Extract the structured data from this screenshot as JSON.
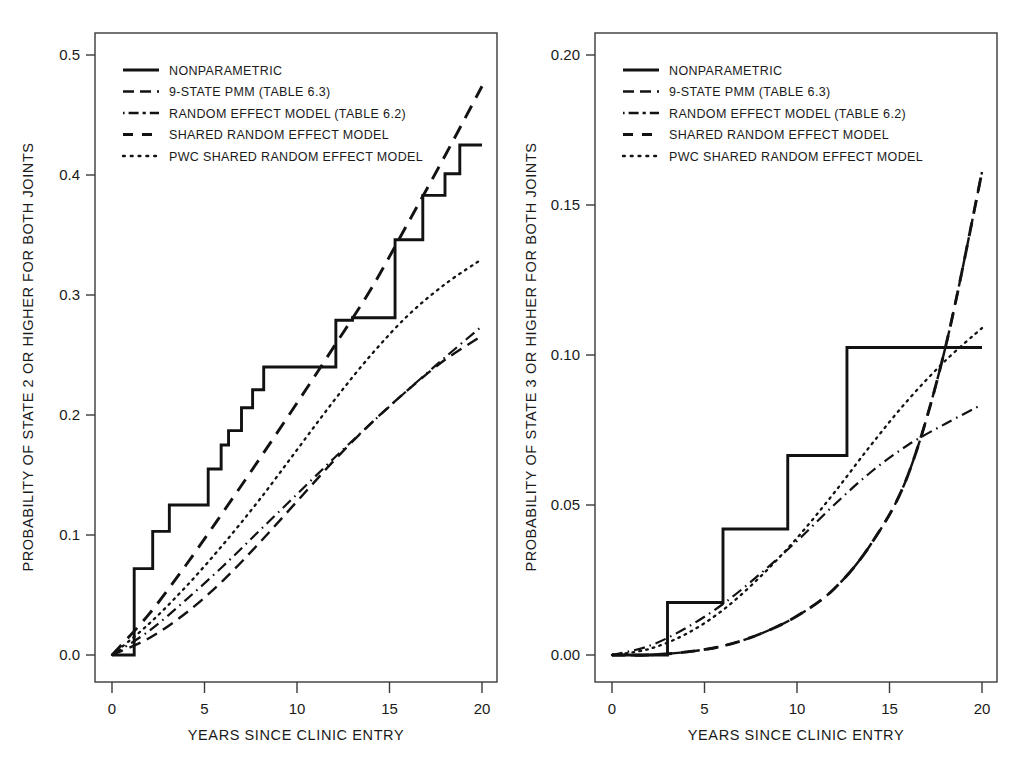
{
  "figure": {
    "title": "",
    "panel_count": 2
  },
  "legend": {
    "entries": [
      {
        "label": "NONPARAMETRIC",
        "style": "solid"
      },
      {
        "label": "9-STATE  PMM  (TABLE 6.3)",
        "style": "dashed"
      },
      {
        "label": "RANDOM  EFFECT  MODEL  (TABLE 6.2)",
        "style": "dash-dot"
      },
      {
        "label": "SHARED  RANDOM EFFECT  MODEL",
        "style": "long-dashed"
      },
      {
        "label": "PWC SHARED  RANDOM  EFFECT  MODEL",
        "style": "dotted"
      }
    ]
  },
  "chart_data": [
    {
      "panel": "left",
      "type": "line",
      "title": "",
      "xlabel": "YEARS SINCE CLINIC ENTRY",
      "ylabel": "PROBABILITY OF STATE 2 OR HIGHER FOR BOTH JOINTS",
      "xlim": [
        0,
        20
      ],
      "ylim": [
        0.0,
        0.5
      ],
      "xticks": [
        0,
        5,
        10,
        15,
        20
      ],
      "xticklabels": [
        "0",
        "5",
        "10",
        "15",
        "20"
      ],
      "yticks": [
        0.0,
        0.1,
        0.2,
        0.3,
        0.4,
        0.5
      ],
      "yticklabels": [
        "0.0",
        "0.1",
        "0.2",
        "0.3",
        "0.4",
        "0.5"
      ],
      "grid": false,
      "legend_position": "top-left",
      "series": [
        {
          "name": "NONPARAMETRIC",
          "style": "solid",
          "kind": "step",
          "x": [
            0,
            1.2,
            1.2,
            2.2,
            2.2,
            3.1,
            3.1,
            3.6,
            3.6,
            5.2,
            5.2,
            5.9,
            5.9,
            6.3,
            6.3,
            7.0,
            7.0,
            7.6,
            7.6,
            8.2,
            8.2,
            9.0,
            9.0,
            12.1,
            12.1,
            13.0,
            13.0,
            15.3,
            15.3,
            16.0,
            16.0,
            16.8,
            16.8,
            18.0,
            18.0,
            18.8,
            18.8,
            20.0
          ],
          "y": [
            0.0,
            0.0,
            0.072,
            0.072,
            0.103,
            0.103,
            0.125,
            0.125,
            0.125,
            0.125,
            0.155,
            0.155,
            0.175,
            0.175,
            0.187,
            0.187,
            0.206,
            0.206,
            0.221,
            0.221,
            0.24,
            0.24,
            0.24,
            0.24,
            0.279,
            0.279,
            0.281,
            0.281,
            0.346,
            0.346,
            0.346,
            0.346,
            0.383,
            0.383,
            0.401,
            0.401,
            0.425,
            0.425
          ]
        },
        {
          "name": "9-STATE  PMM  (TABLE 6.3)",
          "style": "dashed",
          "kind": "smooth",
          "x": [
            0,
            2,
            4,
            6,
            8,
            10,
            12,
            14,
            16,
            18,
            20
          ],
          "y": [
            0.0,
            0.014,
            0.035,
            0.062,
            0.094,
            0.128,
            0.162,
            0.193,
            0.221,
            0.246,
            0.266
          ]
        },
        {
          "name": "RANDOM  EFFECT  MODEL  (TABLE 6.2)",
          "style": "dash-dot",
          "kind": "smooth",
          "x": [
            0,
            2,
            4,
            6,
            8,
            10,
            12,
            14,
            16,
            18,
            20
          ],
          "y": [
            0.0,
            0.02,
            0.046,
            0.074,
            0.104,
            0.134,
            0.164,
            0.193,
            0.221,
            0.248,
            0.274
          ]
        },
        {
          "name": "SHARED  RANDOM EFFECT  MODEL",
          "style": "long-dashed",
          "kind": "smooth",
          "x": [
            0,
            2,
            4,
            6,
            8,
            10,
            12,
            14,
            16,
            18,
            20
          ],
          "y": [
            0.0,
            0.034,
            0.075,
            0.119,
            0.164,
            0.21,
            0.257,
            0.305,
            0.36,
            0.416,
            0.474
          ]
        },
        {
          "name": "PWC SHARED  RANDOM  EFFECT  MODEL",
          "style": "dotted",
          "kind": "smooth",
          "x": [
            0,
            2,
            4,
            6,
            8,
            10,
            12,
            14,
            16,
            18,
            20
          ],
          "y": [
            0.0,
            0.026,
            0.057,
            0.092,
            0.13,
            0.171,
            0.212,
            0.25,
            0.283,
            0.309,
            0.33
          ]
        }
      ]
    },
    {
      "panel": "right",
      "type": "line",
      "title": "",
      "xlabel": "YEARS SINCE CLINIC ENTRY",
      "ylabel": "PROBABILITY OF STATE 3 OR HIGHER FOR BOTH JOINTS",
      "xlim": [
        0,
        20
      ],
      "ylim": [
        0.0,
        0.2
      ],
      "xticks": [
        0,
        5,
        10,
        15,
        20
      ],
      "xticklabels": [
        "0",
        "5",
        "10",
        "15",
        "20"
      ],
      "yticks": [
        0.0,
        0.05,
        0.1,
        0.15,
        0.2
      ],
      "yticklabels": [
        "0.00",
        "0.05",
        "0.10",
        "0.15",
        "0.20"
      ],
      "grid": false,
      "legend_position": "top-left",
      "series": [
        {
          "name": "NONPARAMETRIC",
          "style": "solid",
          "kind": "step",
          "x": [
            0,
            3.0,
            3.0,
            6.0,
            6.0,
            9.5,
            9.5,
            12.7,
            12.7,
            20.0
          ],
          "y": [
            0.0,
            0.0,
            0.0175,
            0.0175,
            0.042,
            0.042,
            0.0665,
            0.0665,
            0.1025,
            0.1025
          ]
        },
        {
          "name": "9-STATE  PMM  (TABLE 6.3)",
          "style": "dashed",
          "kind": "smooth",
          "x": [
            0,
            2,
            4,
            6,
            8,
            10,
            12,
            14,
            16,
            18,
            20
          ],
          "y": [
            0.0,
            0.0,
            0.001,
            0.003,
            0.007,
            0.013,
            0.022,
            0.037,
            0.06,
            0.102,
            0.161
          ]
        },
        {
          "name": "RANDOM  EFFECT  MODEL  (TABLE 6.2)",
          "style": "dash-dot",
          "kind": "smooth",
          "x": [
            0,
            2,
            4,
            6,
            8,
            10,
            12,
            14,
            16,
            18,
            20
          ],
          "y": [
            0.0,
            0.003,
            0.009,
            0.017,
            0.027,
            0.038,
            0.05,
            0.061,
            0.07,
            0.077,
            0.0835
          ]
        },
        {
          "name": "SHARED  RANDOM EFFECT  MODEL",
          "style": "long-dashed",
          "kind": "smooth",
          "x": [
            0,
            2,
            4,
            6,
            8,
            10,
            12,
            14,
            16,
            18,
            20
          ],
          "y": [
            0.0,
            0.0,
            0.001,
            0.003,
            0.007,
            0.013,
            0.022,
            0.037,
            0.06,
            0.102,
            0.161
          ]
        },
        {
          "name": "PWC SHARED  RANDOM  EFFECT  MODEL",
          "style": "dotted",
          "kind": "smooth",
          "x": [
            0,
            2,
            4,
            6,
            8,
            10,
            12,
            14,
            16,
            18,
            20
          ],
          "y": [
            0.0,
            0.002,
            0.007,
            0.015,
            0.026,
            0.039,
            0.054,
            0.07,
            0.085,
            0.098,
            0.109
          ]
        }
      ]
    }
  ]
}
